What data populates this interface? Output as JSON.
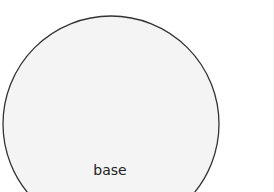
{
  "diagram": {
    "type": "venn",
    "circles": [
      {
        "label": "base",
        "cx": 111,
        "cy": 124,
        "r": 108,
        "fill": "#f4f4f4",
        "stroke": "#333333"
      }
    ]
  },
  "colors": {
    "background": "#ffffff",
    "circle_fill": "#f4f4f4",
    "circle_stroke": "#333333",
    "label_text": "#222222"
  }
}
